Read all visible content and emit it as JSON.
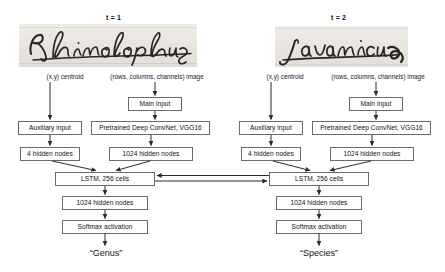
{
  "diagram": {
    "timesteps": [
      {
        "id": "t1",
        "time_label": "t = 1",
        "handwriting_text": "Rhinolophus",
        "input_labels": {
          "centroid": "(x,y) centroid",
          "image": "(rows, columns, channels) image"
        },
        "boxes": {
          "main_input": "Main input",
          "auxiliary_input": "Auxiliary input",
          "convnet": "Pretrained  Deep ConvNet, VGG16",
          "aux_hidden": "4 hidden nodes",
          "conv_hidden": "1024 hidden nodes",
          "lstm": "LSTM, 256 cells",
          "post_hidden": "1024 hidden nodes",
          "softmax": "Softmax activation"
        },
        "output": "“Genus”"
      },
      {
        "id": "t2",
        "time_label": "t = 2",
        "handwriting_text": "javanicus",
        "input_labels": {
          "centroid": "(x,y) centroid",
          "image": "(rows, columns, channels) image"
        },
        "boxes": {
          "main_input": "Main input",
          "auxiliary_input": "Auxiliary input",
          "convnet": "Pretrained  Deep ConvNet, VGG16",
          "aux_hidden": "4 hidden nodes",
          "conv_hidden": "1024 hidden nodes",
          "lstm": "LSTM, 256 cells",
          "post_hidden": "1024 hidden nodes",
          "softmax": "Softmax activation"
        },
        "output": "“Species”"
      }
    ],
    "colors": {
      "box_border": "#6b6b6b",
      "arrow": "#2b2b2b",
      "text": "#111111",
      "canvas": "#ffffff",
      "handwriting_paper": "#e9e6e1",
      "ink": "#262220"
    }
  }
}
